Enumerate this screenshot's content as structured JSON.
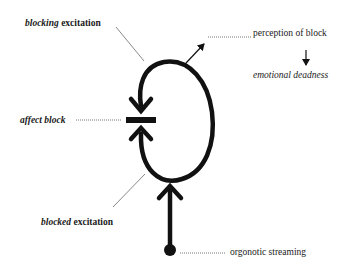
{
  "diagram": {
    "type": "flow",
    "labels": {
      "blocking_excitation": {
        "italic": "blocking",
        "rest": " excitation"
      },
      "perception_of_block": "perception of block",
      "emotional_deadness": "emotional deadness",
      "affect_block": "affect block",
      "blocked_excitation": {
        "italic": "blocked",
        "rest": " excitation"
      },
      "orgonotic_streaming": "orgonotic streaming"
    },
    "nodes": [
      {
        "id": "source",
        "shape": "dot",
        "label": "orgonotic streaming"
      },
      {
        "id": "loop",
        "shape": "closed-loop",
        "label": "excitation loop"
      },
      {
        "id": "block",
        "shape": "bar",
        "label": "affect block"
      }
    ],
    "edges": [
      {
        "from": "source",
        "to": "loop",
        "style": "thick-arrow",
        "direction": "up"
      },
      {
        "from": "loop",
        "to": "block",
        "style": "thick-arrow",
        "direction": "down",
        "label": "blocking excitation"
      },
      {
        "from": "loop",
        "to": "block",
        "style": "thick-arrow",
        "direction": "up",
        "label": "blocked excitation"
      },
      {
        "from": "loop",
        "to": "perception_of_block",
        "style": "thin-arrow"
      },
      {
        "from": "perception_of_block",
        "to": "emotional_deadness",
        "style": "thin-arrow",
        "direction": "down"
      }
    ],
    "colors": {
      "ink": "#111111",
      "leader": "#555555",
      "background": "#ffffff"
    }
  }
}
